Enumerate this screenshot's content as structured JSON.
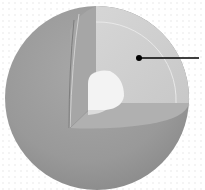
{
  "diagram": {
    "kind": "sphere-cutaway",
    "colors": {
      "background": "#ffffff",
      "dot_pattern": "#f2f2f2",
      "outer_surface": "#9a9a9a",
      "outer_surface_dark": "#8c8c8c",
      "cut_face_vertical": "#b4b4b4",
      "cut_face_section": "#d0d0d0",
      "cut_floor": "#a9a9a9",
      "inner_layer_line": "#e6e6e6",
      "core": "#f2f2f2",
      "leader": "#000000"
    },
    "leader": {
      "dot": {
        "x": 139,
        "y": 58,
        "r": 3
      },
      "line_end": {
        "x": 199,
        "y": 58
      },
      "label": ""
    }
  }
}
